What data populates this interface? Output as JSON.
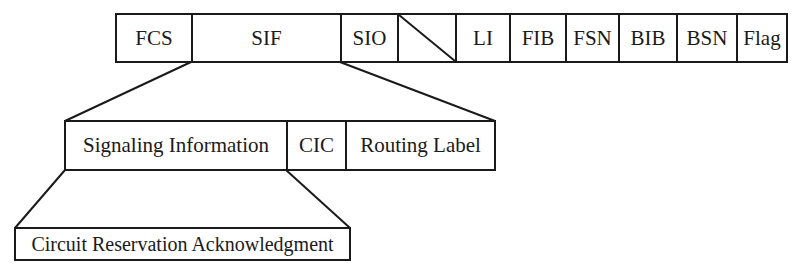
{
  "diagram": {
    "frame_row": {
      "fields": [
        {
          "label": "FCS",
          "width": 75
        },
        {
          "label": "SIF",
          "width": 149
        },
        {
          "label": "SIO",
          "width": 57
        },
        {
          "label": "",
          "width": 58,
          "spare": true
        },
        {
          "label": "LI",
          "width": 54
        },
        {
          "label": "FIB",
          "width": 56
        },
        {
          "label": "FSN",
          "width": 53
        },
        {
          "label": "BIB",
          "width": 58
        },
        {
          "label": "BSN",
          "width": 60
        },
        {
          "label": "Flag",
          "width": 51
        }
      ]
    },
    "sif_row": {
      "fields": [
        {
          "label": "Signaling Information",
          "width": 221
        },
        {
          "label": "CIC",
          "width": 59
        },
        {
          "label": "Routing Label",
          "width": 150
        }
      ]
    },
    "message_row": {
      "fields": [
        {
          "label": "Circuit Reservation Acknowledgment",
          "width": 336
        }
      ]
    },
    "colors": {
      "line": "#1a1a1a",
      "background": "#ffffff"
    }
  }
}
